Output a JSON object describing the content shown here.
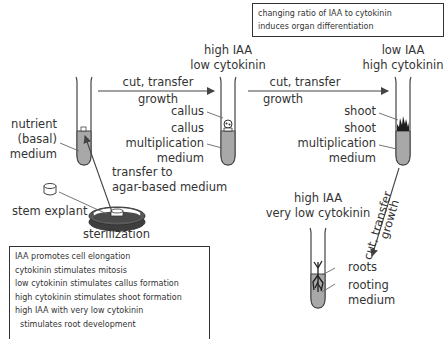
{
  "top_note": {
    "line1": "changing ratio of IAA to cytokinin",
    "line2": "induces organ differentiation"
  },
  "stage_callus": {
    "condition_line1": "high IAA",
    "condition_line2": "low cytokinin",
    "label_callus": "callus",
    "label_medium_line1": "callus",
    "label_medium_line2": "multiplication",
    "label_medium_line3": "medium"
  },
  "stage_shoot": {
    "condition_line1": "low IAA",
    "condition_line2": "high cytokinin",
    "label_shoot": "shoot",
    "label_medium_line1": "shoot",
    "label_medium_line2": "multiplication",
    "label_medium_line3": "medium"
  },
  "stage_root": {
    "condition_line1": "high IAA",
    "condition_line2": "very low cytokinin",
    "label_roots": "roots",
    "label_medium_line1": "rooting",
    "label_medium_line2": "medium"
  },
  "stage_initial": {
    "medium_line1": "nutrient",
    "medium_line2": "(basal)",
    "medium_line3": "medium",
    "transfer_line1": "transfer to",
    "transfer_line2": "agar-based medium",
    "explant": "stem explant",
    "sterilization": "sterilization"
  },
  "arrows": {
    "arrow1_top": "cut, transfer",
    "arrow1_bottom": "growth",
    "arrow2_top": "cut, transfer",
    "arrow2_bottom": "growth",
    "arrow3_top": "cut, transfer",
    "arrow3_bottom": "growth"
  },
  "legend_box": {
    "items": [
      "IAA promotes cell elongation",
      "cytokinin stimulates mitosis",
      "low cytokinin stimulates callus formation",
      "high cytokinin stimulates shoot formation",
      "high IAA with very low cytokinin",
      "  stimulates root development"
    ]
  },
  "colors": {
    "medium_fill": "#a8a8a8",
    "line": "#444444",
    "dark_fill": "#4a4a4a"
  }
}
